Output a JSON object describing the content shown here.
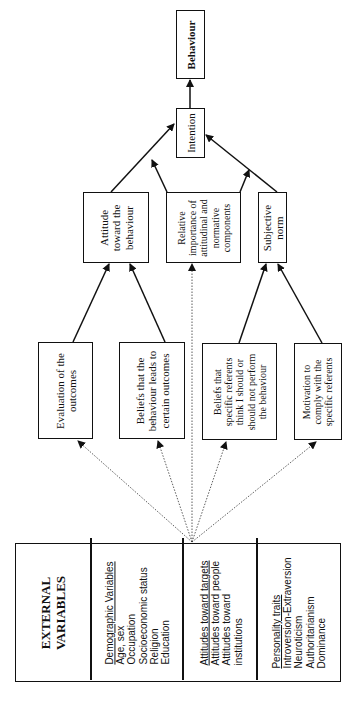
{
  "diagram": {
    "orientation": "rotated -90deg",
    "nodes": {
      "behaviour": {
        "label": "Behaviour"
      },
      "intention": {
        "label": "Intention"
      },
      "attitude": {
        "lines": [
          "Attitude",
          "toward the",
          "behaviour"
        ]
      },
      "relative_importance": {
        "lines": [
          "Relative",
          "importance of",
          "attitudinal and",
          "normative",
          "components"
        ]
      },
      "subjective_norm": {
        "lines": [
          "Subjective",
          "norm"
        ]
      },
      "evaluation": {
        "lines": [
          "Evaluation of the",
          "outcomes"
        ]
      },
      "beliefs_behaviour": {
        "lines": [
          "Beliefs that the",
          "behaviour leads to",
          "certain outcomes"
        ]
      },
      "beliefs_referents": {
        "lines": [
          "Beliefs that",
          "specific referents",
          "think I should or",
          "should not perform",
          "the behaviour"
        ]
      },
      "motivation": {
        "lines": [
          "Motivation to",
          "comply with the",
          "specific referents"
        ]
      }
    },
    "external_variables": {
      "title_lines": [
        "EXTERNAL",
        "VARIABLES"
      ],
      "groups": [
        {
          "heading": "Demographic Variables",
          "items": [
            "Age, sex",
            "Occupation",
            "Socioeconomic status",
            "Religion",
            "Education"
          ]
        },
        {
          "heading": "Attitudes toward targets",
          "items": [
            "Attitudes toward people",
            "Attitudes toward",
            "institutions"
          ]
        },
        {
          "heading": "Personality traits",
          "items": [
            "Introversion-Extraversion",
            "Neuroticism",
            "Authoritarianism",
            "Dominance"
          ]
        }
      ]
    },
    "edges": [
      {
        "from": "intention",
        "to": "behaviour",
        "style": "solid"
      },
      {
        "from": "attitude",
        "to": "intention",
        "style": "solid"
      },
      {
        "from": "relative_importance",
        "to": "intention",
        "style": "solid"
      },
      {
        "from": "subjective_norm",
        "to": "intention",
        "style": "solid"
      },
      {
        "from": "relative_importance",
        "to": "subjective_norm_intention_link",
        "style": "solid"
      },
      {
        "from": "evaluation",
        "to": "attitude",
        "style": "solid"
      },
      {
        "from": "beliefs_behaviour",
        "to": "attitude",
        "style": "solid"
      },
      {
        "from": "beliefs_referents",
        "to": "subjective_norm",
        "style": "solid"
      },
      {
        "from": "motivation",
        "to": "subjective_norm",
        "style": "solid"
      },
      {
        "from": "external_variables",
        "to": "evaluation",
        "style": "dotted"
      },
      {
        "from": "external_variables",
        "to": "beliefs_behaviour",
        "style": "dotted"
      },
      {
        "from": "external_variables",
        "to": "relative_importance",
        "style": "dotted"
      },
      {
        "from": "external_variables",
        "to": "beliefs_referents",
        "style": "dotted"
      },
      {
        "from": "external_variables",
        "to": "motivation",
        "style": "dotted"
      }
    ],
    "colors": {
      "line": "#111111",
      "background": "#ffffff"
    }
  }
}
